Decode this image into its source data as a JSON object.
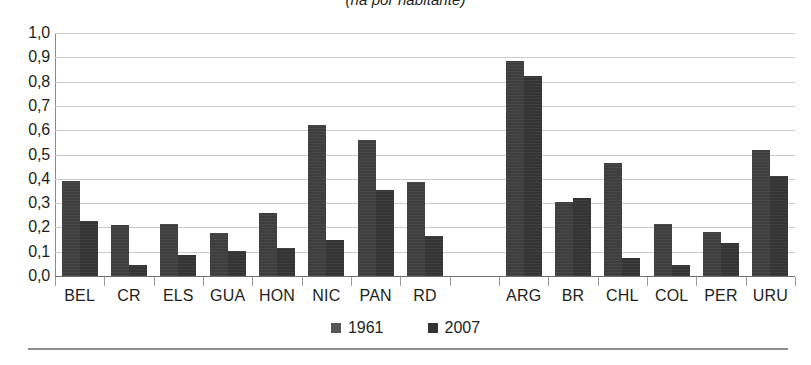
{
  "chart_data": {
    "type": "bar",
    "title": "(ha por habitante)",
    "xlabel": "",
    "ylabel": "",
    "ylim": [
      0.0,
      1.0
    ],
    "grid": true,
    "legend_position": "bottom-center",
    "y_tick_labels": [
      "1,0",
      "0,9",
      "0,8",
      "0,7",
      "0,6",
      "0,5",
      "0,4",
      "0,3",
      "0,2",
      "0,1",
      "0,0"
    ],
    "y_ticks": [
      1.0,
      0.9,
      0.8,
      0.7,
      0.6,
      0.5,
      0.4,
      0.3,
      0.2,
      0.1,
      0.0
    ],
    "categories": [
      "BEL",
      "CR",
      "ELS",
      "GUA",
      "HON",
      "NIC",
      "PAN",
      "RD",
      "",
      "ARG",
      "BR",
      "CHL",
      "COL",
      "PER",
      "URU"
    ],
    "series": [
      {
        "name": "1961",
        "color": "#3e3e3e",
        "values": [
          0.39,
          0.21,
          0.215,
          0.175,
          0.26,
          0.62,
          0.56,
          0.385,
          null,
          0.885,
          0.305,
          0.465,
          0.215,
          0.18,
          0.52
        ]
      },
      {
        "name": "2007",
        "color": "#343434",
        "values": [
          0.225,
          0.045,
          0.085,
          0.105,
          0.115,
          0.15,
          0.355,
          0.165,
          null,
          0.825,
          0.32,
          0.075,
          0.045,
          0.135,
          0.41
        ]
      }
    ],
    "legend": [
      "1961",
      "2007"
    ]
  }
}
